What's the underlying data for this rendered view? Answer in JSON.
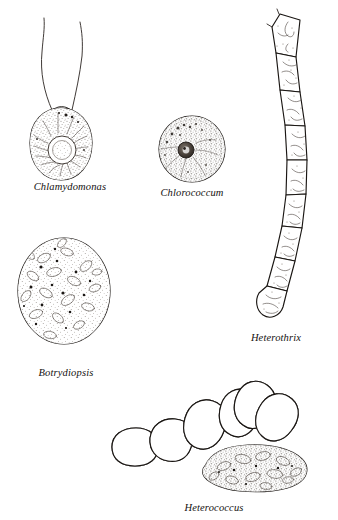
{
  "plate": {
    "title": "Algae cell morphology plate",
    "background_color": "#ffffff",
    "ink_color": "#1a1613",
    "label_color": "#14110f",
    "width": 338,
    "height": 520
  },
  "figures": [
    {
      "id": "chlamydomonas",
      "label": "Chlamydomonas",
      "label_x": 70,
      "label_y": 190,
      "description": "Ovoid unicell with two apical flagella, cup-shaped chloroplast and central pyrenoid",
      "features": [
        "two-flagella",
        "cup-chloroplast",
        "pyrenoid",
        "stippled-cytoplasm"
      ]
    },
    {
      "id": "chlorococcum",
      "label": "Chlorococcum",
      "label_x": 192,
      "label_y": 196,
      "description": "Spherical unicell with double cell wall and dark central pyrenoid",
      "features": [
        "double-wall",
        "pyrenoid",
        "granular-cytoplasm"
      ]
    },
    {
      "id": "heterothrix",
      "label": "Heterothrix",
      "label_x": 276,
      "label_y": 341,
      "description": "Unbranched curved filament of about nine cylindrical cells with rounded terminal cell",
      "features": [
        "filament",
        "nine-cells",
        "discoid-chloroplasts",
        "rounded-apex"
      ],
      "cell_count": 9
    },
    {
      "id": "botrydiopsis",
      "label": "Botrydiopsis",
      "label_x": 66,
      "label_y": 376,
      "description": "Large spherical coenocytic cell packed with numerous discoid chloroplasts and oil droplets",
      "features": [
        "spherical",
        "many-chloroplasts",
        "oil-droplets"
      ]
    },
    {
      "id": "heterococcus",
      "label": "Heterococcus",
      "label_x": 214,
      "label_y": 511,
      "description": "Irregularly branched thallus of swollen ovoid cells with one elongate basal cell",
      "features": [
        "branched",
        "ovoid-cells",
        "elongate-cell"
      ]
    }
  ]
}
